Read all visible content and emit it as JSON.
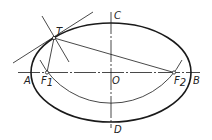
{
  "diagram": {
    "type": "ellipse-tangent-construction",
    "colors": {
      "stroke": "#1a1a1a",
      "background": "#ffffff"
    },
    "ellipse": {
      "cx": 111,
      "cy": 72.5,
      "rx": 80,
      "ry": 49.5
    },
    "labels": {
      "A": "A",
      "B": "B",
      "C": "C",
      "D": "D",
      "O": "O",
      "T": "T",
      "F1_main": "F",
      "F1_sub": "1",
      "F2_main": "F",
      "F2_sub": "2"
    },
    "points": {
      "A": [
        31,
        72.5
      ],
      "B": [
        191,
        72.5
      ],
      "C": [
        111,
        23
      ],
      "D": [
        111,
        122
      ],
      "O": [
        111,
        72.5
      ],
      "T": [
        54,
        38
      ],
      "F1": [
        47,
        72.5
      ],
      "F2": [
        174,
        72.5
      ]
    },
    "lines": {
      "major_axis": [
        18,
        72.5,
        200,
        72.5
      ],
      "minor_axis": [
        111,
        12,
        111,
        128
      ],
      "tangent": [
        13,
        63,
        93,
        12
      ],
      "normal": [
        42,
        16,
        69,
        62
      ],
      "T_to_F1": [
        54,
        38,
        47,
        72.5
      ],
      "T_to_F2": [
        54,
        38,
        174,
        72.5
      ]
    },
    "arc": {
      "center": "C",
      "radius": 80,
      "description": "arc centered at C with radius a, passing through F1 and F2"
    }
  }
}
